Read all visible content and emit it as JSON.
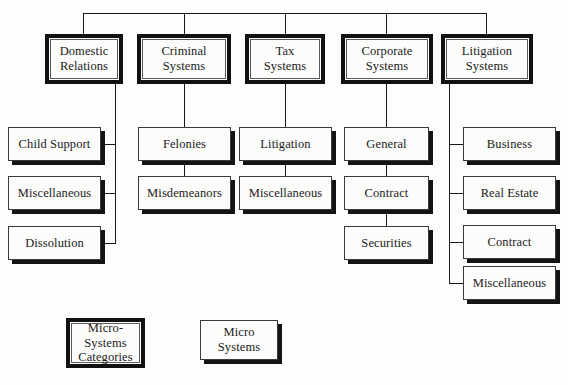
{
  "diagram": {
    "root_bus_label": "top-level distribution bus",
    "categories": [
      {
        "id": "domestic-relations",
        "label": "Domestic\nRelations",
        "children": [
          {
            "id": "child-support",
            "label": "Child Support"
          },
          {
            "id": "dr-misc",
            "label": "Miscellaneous"
          },
          {
            "id": "dissolution",
            "label": "Dissolution"
          }
        ]
      },
      {
        "id": "criminal-systems",
        "label": "Criminal\nSystems",
        "children": [
          {
            "id": "felonies",
            "label": "Felonies"
          },
          {
            "id": "misdemeanors",
            "label": "Misdemeanors"
          }
        ]
      },
      {
        "id": "tax-systems",
        "label": "Tax\nSystems",
        "children": [
          {
            "id": "tax-litigation",
            "label": "Litigation"
          },
          {
            "id": "tax-misc",
            "label": "Miscellaneous"
          }
        ]
      },
      {
        "id": "corporate-systems",
        "label": "Corporate\nSystems",
        "children": [
          {
            "id": "corp-general",
            "label": "General"
          },
          {
            "id": "corp-contract",
            "label": "Contract"
          },
          {
            "id": "corp-securities",
            "label": "Securities"
          }
        ]
      },
      {
        "id": "litigation-systems",
        "label": "Litigation\nSystems",
        "children": [
          {
            "id": "lit-business",
            "label": "Business"
          },
          {
            "id": "lit-real-estate",
            "label": "Real Estate"
          },
          {
            "id": "lit-contract",
            "label": "Contract"
          },
          {
            "id": "lit-misc",
            "label": "Miscellaneous"
          }
        ]
      }
    ],
    "legend": [
      {
        "id": "legend-category",
        "label": "Micro-\nSystems\nCategories",
        "style": "category"
      },
      {
        "id": "legend-micro",
        "label": "Micro\nSystems",
        "style": "micro"
      }
    ],
    "colors": {
      "background": "#fdfdfc",
      "box_fill": "#fcfcfb",
      "heavy_border": "#111111",
      "thin_border": "#3a3a3a",
      "shadow": "#141414",
      "line": "#1a1a1a",
      "text": "#1b1b1b"
    }
  }
}
